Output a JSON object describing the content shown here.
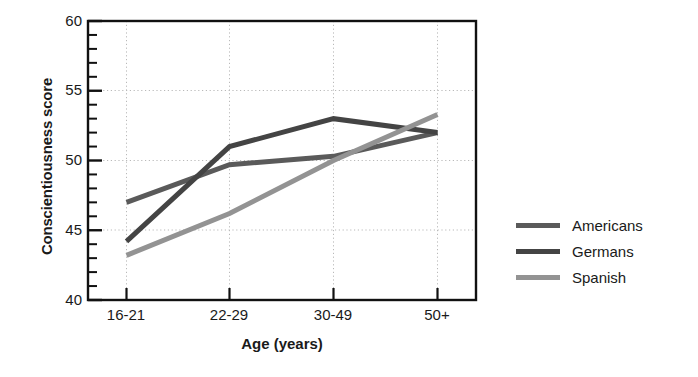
{
  "chart_data": {
    "type": "line",
    "title": "",
    "xlabel": "Age (years)",
    "ylabel": "Conscientiousness score",
    "categories": [
      "16-21",
      "22-29",
      "30-49",
      "50+"
    ],
    "ylim": [
      40,
      60
    ],
    "ytick_labels": [
      "40",
      "45",
      "50",
      "55",
      "60"
    ],
    "ytick_values": [
      40,
      45,
      50,
      55,
      60
    ],
    "ymajor_step": 5,
    "yminor_step": 1,
    "grid": "dotted major gridlines, horizontal and vertical",
    "legend_position": "right, outside axes",
    "series": [
      {
        "name": "Americans",
        "color": "#5a5a5a",
        "values": [
          47.0,
          49.7,
          50.3,
          52.0
        ]
      },
      {
        "name": "Germans",
        "color": "#444444",
        "values": [
          44.2,
          51.0,
          53.0,
          52.0
        ]
      },
      {
        "name": "Spanish",
        "color": "#939393",
        "values": [
          43.2,
          46.2,
          50.0,
          53.3
        ]
      }
    ]
  },
  "axes": {
    "ylabel": "Conscientiousness score",
    "xlabel": "Age (years)",
    "ytick_0": "40",
    "ytick_1": "45",
    "ytick_2": "50",
    "ytick_3": "55",
    "ytick_4": "60",
    "xtick_0": "16-21",
    "xtick_1": "22-29",
    "xtick_2": "30-49",
    "xtick_3": "50+"
  },
  "legend": {
    "items": [
      {
        "label": "Americans",
        "color": "#5a5a5a"
      },
      {
        "label": "Germans",
        "color": "#444444"
      },
      {
        "label": "Spanish",
        "color": "#939393"
      }
    ]
  }
}
